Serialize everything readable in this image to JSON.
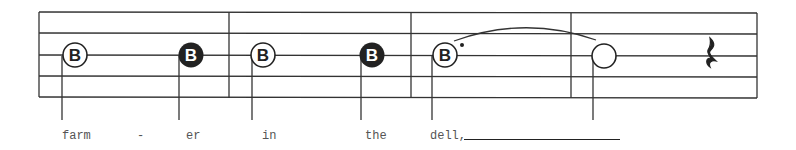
{
  "staff": {
    "lines_y": [
      12,
      33,
      55,
      76,
      97
    ],
    "left": 39,
    "right": 757,
    "barlines_x": [
      229,
      411,
      571
    ],
    "line_color": "#333333"
  },
  "notes": [
    {
      "letter": "B",
      "x": 75,
      "y": 55,
      "style": "open-letter",
      "stem_x": 62,
      "lyric": "farm",
      "duration": "quarter-open"
    },
    {
      "letter": "B",
      "x": 191,
      "y": 55,
      "style": "filled-letter",
      "stem_x": 179,
      "lyric": "er",
      "duration": "quarter-filled"
    },
    {
      "letter": "B",
      "x": 263,
      "y": 55,
      "style": "open-letter",
      "stem_x": 252,
      "lyric": "in",
      "duration": "quarter-open"
    },
    {
      "letter": "B",
      "x": 372,
      "y": 55,
      "style": "filled-letter",
      "stem_x": 361,
      "lyric": "the",
      "duration": "quarter-filled"
    },
    {
      "letter": "B",
      "x": 445,
      "y": 55,
      "style": "open-letter-dotted",
      "stem_x": 432,
      "lyric": "dell,",
      "duration": "dotted-half"
    },
    {
      "letter": "",
      "x": 604,
      "y": 56,
      "style": "open-empty",
      "stem_x": 593,
      "lyric": "",
      "duration": "half-tied"
    }
  ],
  "rest": {
    "type": "quarter-rest-icon",
    "x": 712,
    "y": 55
  },
  "tie": {
    "from_x": 454,
    "to_x": 596,
    "y": 40,
    "peak_y": 27
  },
  "dot": {
    "x": 462,
    "y": 45
  },
  "lyrics": [
    {
      "text": "farm",
      "x": 62
    },
    {
      "text": "-",
      "x": 137
    },
    {
      "text": "er",
      "x": 186
    },
    {
      "text": "in",
      "x": 262
    },
    {
      "text": "the",
      "x": 365
    },
    {
      "text": "dell,",
      "x": 430
    }
  ],
  "extender": {
    "x1": 464,
    "x2": 620
  }
}
